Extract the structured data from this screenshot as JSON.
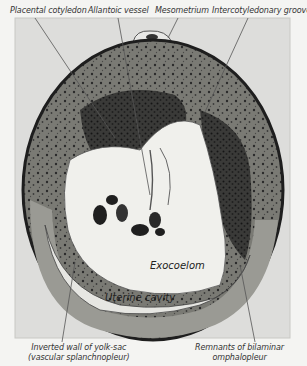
{
  "figure": {
    "type": "histology-section",
    "colors": {
      "background": "#f4f4f2",
      "frame_fill": "#dcdcd8",
      "tissue_dark": "#2e2e2e",
      "tissue_mid": "#6a6a66",
      "cavity": "#ecece8",
      "leader_line": "#555555"
    },
    "top_labels": [
      {
        "text": "Placental cotyledon"
      },
      {
        "text": "Allantoic vessel"
      },
      {
        "text": "Mesometrium"
      },
      {
        "text": "Intercotyledonary groove"
      }
    ],
    "bottom_labels": [
      {
        "line1": "Inverted wall of yolk-sac",
        "line2": "(vascular splanchnopleur)"
      },
      {
        "line1": "Remnants of bilaminar",
        "line2": "omphalopleur"
      }
    ],
    "inner_labels": [
      {
        "text": "Exocoelom"
      },
      {
        "text": "Uterine cavity"
      }
    ]
  }
}
